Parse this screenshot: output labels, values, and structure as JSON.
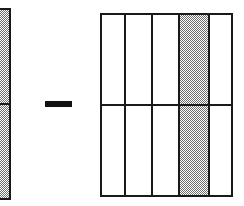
{
  "figure": {
    "background_color": "#ffffff",
    "stroke_color": "#1a1a1a",
    "shading_color": "#6e6e6e",
    "width": 244,
    "height": 206
  },
  "left_bar": {
    "name": "minuend-bar",
    "label": "",
    "shaded": "true",
    "cropped_at_left_edge": "true",
    "x": 0,
    "y": 8,
    "width": 11,
    "height": 192,
    "rows": 2,
    "row_divider_y": 104
  },
  "operator": {
    "name": "minus-sign",
    "symbol": "−",
    "label": "",
    "x": 45,
    "y": 101,
    "width": 27,
    "height": 6
  },
  "right_grid": {
    "name": "subtrahend-grid",
    "label": "",
    "x": 100,
    "y": 13,
    "width": 133,
    "height": 184,
    "columns": 5,
    "rows": 2,
    "column_edges": [
      100,
      124,
      151,
      178,
      208,
      233
    ],
    "row_divider_y": 104,
    "shaded_columns": [
      4
    ],
    "cells": [
      {
        "col": 1,
        "row": 1,
        "shaded": "false",
        "value": ""
      },
      {
        "col": 2,
        "row": 1,
        "shaded": "false",
        "value": ""
      },
      {
        "col": 3,
        "row": 1,
        "shaded": "false",
        "value": ""
      },
      {
        "col": 4,
        "row": 1,
        "shaded": "true",
        "value": ""
      },
      {
        "col": 5,
        "row": 1,
        "shaded": "false",
        "value": ""
      },
      {
        "col": 1,
        "row": 2,
        "shaded": "false",
        "value": ""
      },
      {
        "col": 2,
        "row": 2,
        "shaded": "false",
        "value": ""
      },
      {
        "col": 3,
        "row": 2,
        "shaded": "false",
        "value": ""
      },
      {
        "col": 4,
        "row": 2,
        "shaded": "true",
        "value": ""
      },
      {
        "col": 5,
        "row": 2,
        "shaded": "false",
        "value": ""
      }
    ]
  },
  "chart_data": {
    "type": "bar",
    "title": "",
    "xlabel": "",
    "ylabel": "",
    "categories": [
      "minuend",
      "subtrahend"
    ],
    "series": [
      {
        "name": "shaded-parts",
        "values": [
          2,
          2
        ]
      },
      {
        "name": "total-parts",
        "values": [
          2,
          10
        ]
      }
    ],
    "annotations": [
      "−"
    ],
    "grid": "on",
    "legend": "none"
  }
}
